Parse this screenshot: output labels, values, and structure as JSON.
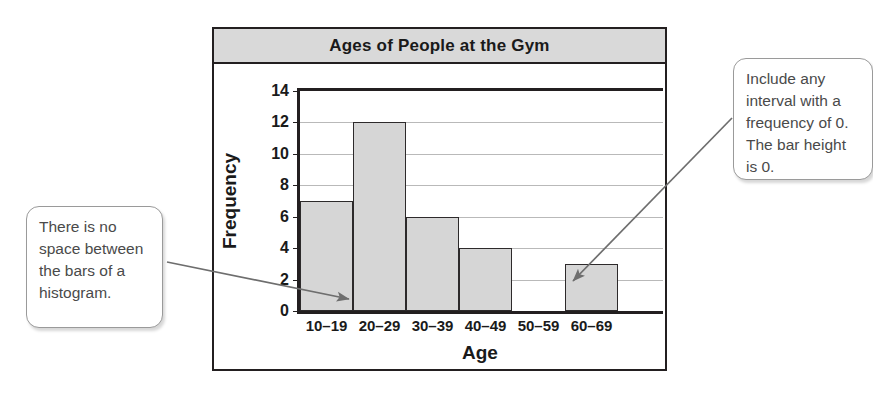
{
  "chart_data": {
    "type": "bar",
    "title": "Ages of People at the Gym",
    "xlabel": "Age",
    "ylabel": "Frequency",
    "categories": [
      "10–19",
      "20–29",
      "30–39",
      "40–49",
      "50–59",
      "60–69"
    ],
    "values": [
      7,
      12,
      6,
      4,
      0,
      3
    ],
    "ylim": [
      0,
      14
    ],
    "ytick_step": 2,
    "yticks": [
      "0",
      "2",
      "4",
      "6",
      "8",
      "10",
      "12",
      "14"
    ],
    "grid": true,
    "legend": "none",
    "bar_fill": "#d6d6d6",
    "bar_stroke": "#2d2a2b",
    "title_bar_fill": "#d9d9d9"
  },
  "callouts": {
    "left": {
      "text": "There is no space between the bars of a histogram."
    },
    "right": {
      "text": "Include any interval with a frequency of 0. The bar height is 0."
    }
  }
}
